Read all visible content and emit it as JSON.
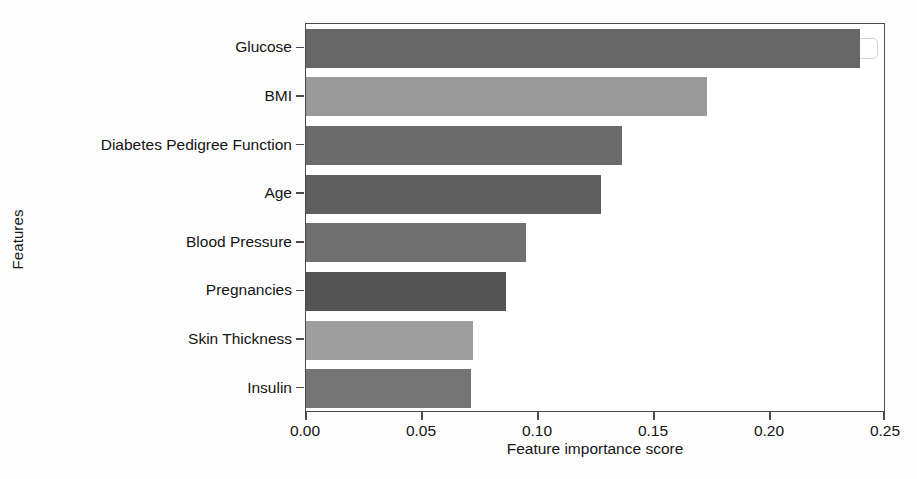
{
  "chart_data": {
    "type": "bar",
    "orientation": "horizontal",
    "title": "",
    "xlabel": "Feature importance score",
    "ylabel": "Features",
    "categories": [
      "Glucose",
      "BMI",
      "Diabetes Pedigree Function",
      "Age",
      "Blood Pressure",
      "Pregnancies",
      "Skin Thickness",
      "Insulin"
    ],
    "values": [
      0.239,
      0.173,
      0.136,
      0.127,
      0.095,
      0.086,
      0.072,
      0.071
    ],
    "bar_colors": [
      "#666666",
      "#9a9a9a",
      "#6b6b6b",
      "#5f5f5f",
      "#707070",
      "#545454",
      "#9e9e9e",
      "#757575"
    ],
    "xlim": [
      0.0,
      0.25
    ],
    "xticks": [
      0.0,
      0.05,
      0.1,
      0.15,
      0.2,
      0.25
    ],
    "xtick_labels": [
      "0.00",
      "0.05",
      "0.10",
      "0.15",
      "0.20",
      "0.25"
    ],
    "grid": false,
    "legend": null
  },
  "figure": {
    "background_color": "#ffffff",
    "axes_color": "#4a4a4a"
  }
}
